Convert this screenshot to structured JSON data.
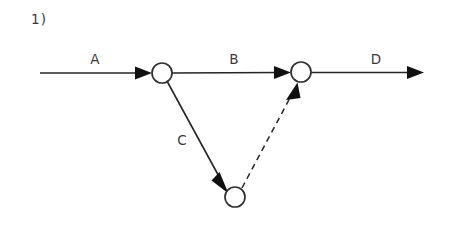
{
  "figure": {
    "number_label": "1)",
    "background_color": "#ffffff",
    "stroke_color": "#252525",
    "label_color": "#3a3a3a",
    "width": 450,
    "height": 225
  },
  "diagram": {
    "type": "activity-on-arrow-network",
    "nodes": [
      {
        "id": "n1",
        "label": "",
        "cx": 162,
        "cy": 73,
        "r": 10
      },
      {
        "id": "n2",
        "label": "",
        "cx": 301,
        "cy": 72,
        "r": 10
      },
      {
        "id": "n3",
        "label": "",
        "cx": 235,
        "cy": 197,
        "r": 10
      }
    ],
    "edges": [
      {
        "id": "a",
        "label": "A",
        "style": "solid",
        "from": "start",
        "to": "n1",
        "label_x": 95,
        "label_y": 64
      },
      {
        "id": "b",
        "label": "B",
        "style": "solid",
        "from": "n1",
        "to": "n2",
        "label_x": 234,
        "label_y": 64
      },
      {
        "id": "c",
        "label": "C",
        "style": "solid",
        "from": "n1",
        "to": "n3",
        "label_x": 182,
        "label_y": 145
      },
      {
        "id": "d",
        "label": "D",
        "style": "solid",
        "from": "n2",
        "to": "end",
        "label_x": 376,
        "label_y": 64
      },
      {
        "id": "dummy",
        "label": "",
        "style": "dashed",
        "from": "n3",
        "to": "n2",
        "label_x": 0,
        "label_y": 0
      }
    ]
  }
}
